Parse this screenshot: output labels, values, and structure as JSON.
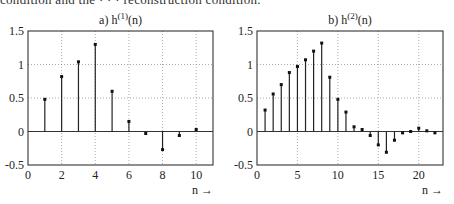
{
  "cropped_top_line": "condition and the · · · reconstruction condition.",
  "chart_data": [
    {
      "type": "stem",
      "title": "a) h(1)(n)",
      "title_main": "a) h",
      "title_sup": "(1)",
      "title_tail": "(n)",
      "xlabel": "n →",
      "ylabel": "",
      "xlim": [
        0,
        11
      ],
      "ylim": [
        -0.5,
        1.5
      ],
      "xticks": [
        0,
        2,
        4,
        6,
        8,
        10
      ],
      "xtick_labels": [
        "0",
        "2",
        "4",
        "6",
        "8",
        "10"
      ],
      "yticks": [
        -0.5,
        0,
        0.5,
        1,
        1.5
      ],
      "ytick_labels": [
        "-0.5",
        "0",
        "0.5",
        "1",
        "1.5"
      ],
      "grid": "dotted",
      "x": [
        1,
        2,
        3,
        4,
        5,
        6,
        7,
        8,
        9,
        10
      ],
      "values": [
        0.48,
        0.82,
        1.04,
        1.3,
        0.6,
        0.15,
        -0.03,
        -0.27,
        -0.06,
        0.03
      ]
    },
    {
      "type": "stem",
      "title": "b) h(2)(n)",
      "title_main": "b) h",
      "title_sup": "(2)",
      "title_tail": "(n)",
      "xlabel": "n →",
      "ylabel": "",
      "xlim": [
        0,
        23
      ],
      "ylim": [
        -0.5,
        1.5
      ],
      "xticks": [
        0,
        5,
        10,
        15,
        20
      ],
      "xtick_labels": [
        "0",
        "5",
        "10",
        "15",
        "20"
      ],
      "yticks": [
        -0.5,
        0,
        0.5,
        1,
        1.5
      ],
      "ytick_labels": [
        "-0.5",
        "0",
        "0.5",
        "1",
        "1.5"
      ],
      "grid": "dotted",
      "x": [
        1,
        2,
        3,
        4,
        5,
        6,
        7,
        8,
        9,
        10,
        11,
        12,
        13,
        14,
        15,
        16,
        17,
        18,
        19,
        20,
        21,
        22
      ],
      "values": [
        0.32,
        0.56,
        0.7,
        0.88,
        0.97,
        1.07,
        1.2,
        1.32,
        0.81,
        0.48,
        0.29,
        0.07,
        0.03,
        -0.06,
        -0.2,
        -0.31,
        -0.13,
        -0.02,
        0.0,
        0.05,
        0.01,
        -0.02
      ]
    }
  ],
  "layout": {
    "panels": [
      {
        "left": 28,
        "right": 213,
        "top": 31,
        "bottom": 165
      },
      {
        "left": 257,
        "right": 443,
        "top": 31,
        "bottom": 165
      }
    ]
  }
}
